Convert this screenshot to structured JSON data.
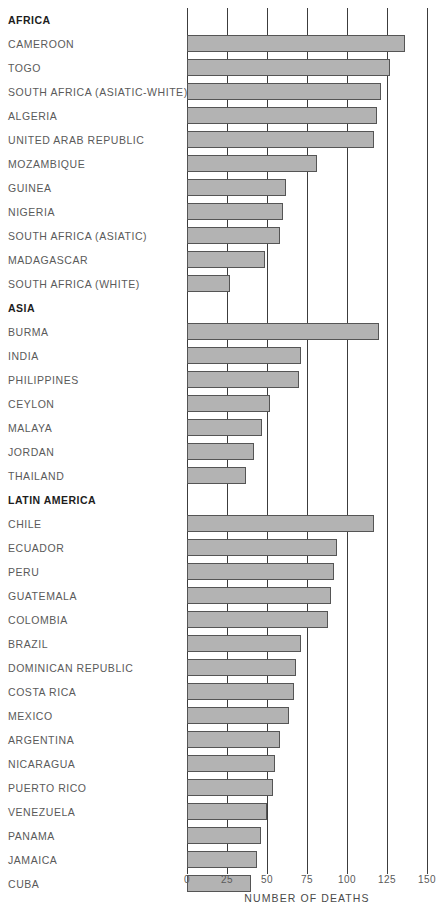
{
  "chart_data": {
    "type": "bar",
    "orientation": "horizontal",
    "title": "",
    "xlabel": "NUMBER OF DEATHS",
    "ylabel": "",
    "xlim": [
      0,
      150
    ],
    "xticks": [
      0,
      25,
      50,
      75,
      100,
      125,
      150
    ],
    "xtick_labels": [
      "0",
      "25",
      "50",
      "75",
      "100",
      "125",
      "150"
    ],
    "grid": "vertical",
    "legend": "none",
    "bar_color": "#b3b3b3",
    "bar_border_color": "#555555",
    "groups": [
      {
        "name": "AFRICA",
        "categories": [
          "CAMEROON",
          "TOGO",
          "SOUTH AFRICA (ASIATIC-WHITE)",
          "ALGERIA",
          "UNITED ARAB REPUBLIC",
          "MOZAMBIQUE",
          "GUINEA",
          "NIGERIA",
          "SOUTH AFRICA (ASIATIC)",
          "MADAGASCAR",
          "SOUTH AFRICA (WHITE)"
        ],
        "values": [
          136,
          127,
          121,
          119,
          117,
          81,
          62,
          60,
          58,
          49,
          27
        ]
      },
      {
        "name": "ASIA",
        "categories": [
          "BURMA",
          "INDIA",
          "PHILIPPINES",
          "CEYLON",
          "MALAYA",
          "JORDAN",
          "THAILAND"
        ],
        "values": [
          120,
          71,
          70,
          52,
          47,
          42,
          37
        ]
      },
      {
        "name": "LATIN AMERICA",
        "categories": [
          "CHILE",
          "ECUADOR",
          "PERU",
          "GUATEMALA",
          "COLOMBIA",
          "BRAZIL",
          "DOMINICAN REPUBLIC",
          "COSTA RICA",
          "MEXICO",
          "ARGENTINA",
          "NICARAGUA",
          "PUERTO RICO",
          "VENEZUELA",
          "PANAMA",
          "JAMAICA",
          "CUBA"
        ],
        "values": [
          117,
          94,
          92,
          90,
          88,
          71,
          68,
          67,
          64,
          58,
          55,
          54,
          50,
          46,
          44,
          40
        ]
      }
    ]
  }
}
